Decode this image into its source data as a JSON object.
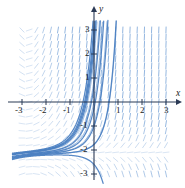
{
  "figure": {
    "title": "",
    "axis_label_x": "x",
    "axis_label_y": "y",
    "colors": {
      "field": "#7da7d9",
      "curve": "#4a7fc1",
      "axis": "#2b3a55",
      "text": "#1a1a1a",
      "background": "#ffffff"
    }
  },
  "ticks": {
    "x": [
      "-3",
      "-2",
      "-1",
      "1",
      "2",
      "3"
    ],
    "y": [
      "3",
      "2",
      "1",
      "-1",
      "-2",
      "-3"
    ]
  },
  "chart_data": {
    "type": "scatter",
    "title": "",
    "xlabel": "x",
    "ylabel": "y",
    "xlim": [
      -3.4,
      3.4
    ],
    "ylim": [
      -3.4,
      3.4
    ],
    "xticks": [
      -3,
      -2,
      -1,
      1,
      2,
      3
    ],
    "yticks": [
      3,
      2,
      1,
      -1,
      -2,
      -3
    ],
    "grid": false,
    "legend": null,
    "plot_kind": "direction-field-with-solution-curves",
    "slope_function": "dy/dx = (y + 2) * (x + 2.8) ... rendered as normalized field segments",
    "field": {
      "description": "short blue line segments on a regular lattice showing slope direction",
      "x_start": -3.0,
      "x_end": 3.0,
      "y_start": -3.0,
      "y_end": 3.0,
      "nx": 21,
      "ny": 21,
      "segment_len_px": 6,
      "color": "#7da7d9"
    },
    "curves": {
      "count": 9,
      "color": "#4a7fc1",
      "description": "solution curves emanating from a common funnel near (-2.8,-2.2); upper ones rise steeply to the top edge, lower ones arch over and fall to the bottom edge",
      "funnel_point": [
        -2.8,
        -2.2
      ],
      "series": [
        {
          "name": "c1",
          "note": "steep rise, exits top near x=-0.35"
        },
        {
          "name": "c2",
          "note": "steep rise, exits top near x=0.05"
        },
        {
          "name": "c3",
          "note": "rise, exits top near x=0.45"
        },
        {
          "name": "c4",
          "note": "rise, exits right-top near x=1.55"
        },
        {
          "name": "c5",
          "note": "arches over, peak near (-0.6,-0.1), falls to bottom near x=1.0"
        },
        {
          "name": "c6",
          "note": "arches over, peak near (-0.8,-0.55), falls to bottom near x=0.7"
        },
        {
          "name": "c7",
          "note": "arches over, peak near (-1.0,-0.95), falls to bottom near x=0.4"
        },
        {
          "name": "c8",
          "note": "arches over, peak near (-1.2,-1.35), falls to bottom near x=0.15"
        },
        {
          "name": "c9",
          "note": "arches over, peak near (-1.5,-1.75), falls to bottom near x=-0.1"
        }
      ]
    }
  },
  "geometry": {
    "origin_px": [
      94,
      102
    ],
    "unit_px": 24
  }
}
